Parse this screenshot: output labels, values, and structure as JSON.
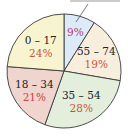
{
  "chart_data": {
    "type": "pie",
    "title": "",
    "start_angle_deg": 0,
    "direction": "clockwise",
    "slices": [
      {
        "label": "",
        "value": 9,
        "pct_text": "9%",
        "color": "#dcebf7",
        "pct_color": "#b0427a"
      },
      {
        "label": "55 – 74",
        "value": 19,
        "pct_text": "19%",
        "color": "#f8eedd",
        "pct_color": "#c8553a"
      },
      {
        "label": "35 – 54",
        "value": 28,
        "pct_text": "28%",
        "color": "#e3eedd",
        "pct_color": "#c8553a"
      },
      {
        "label": "18 – 34",
        "value": 21,
        "pct_text": "21%",
        "color": "#f0d5cf",
        "pct_color": "#d0404a"
      },
      {
        "label": "0 – 17",
        "value": 24,
        "pct_text": "24%",
        "color": "#f8f4cf",
        "pct_color": "#c8553a"
      }
    ],
    "units": "%",
    "legend": "none"
  },
  "style": {
    "edge_color": "#3a3a3a",
    "background": "#ffffff"
  }
}
